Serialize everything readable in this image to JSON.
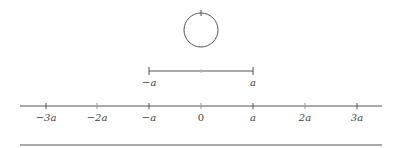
{
  "figure": {
    "circle": {
      "cx": 201,
      "cy": 30,
      "r": 17,
      "stroke": "#555555"
    },
    "segment": {
      "x1": 149,
      "x2": 253,
      "y": 71,
      "left_label": "−a",
      "right_label": "a"
    },
    "axis": {
      "x1": 20,
      "x2": 382,
      "y": 106,
      "ticks": [
        {
          "x": 46,
          "label": "−3a"
        },
        {
          "x": 97,
          "label": "−2a"
        },
        {
          "x": 149,
          "label": "−a"
        },
        {
          "x": 201,
          "label": "0"
        },
        {
          "x": 253,
          "label": "a"
        },
        {
          "x": 305,
          "label": "2a"
        },
        {
          "x": 357,
          "label": "3a"
        }
      ]
    },
    "bottom_rule": {
      "x1": 20,
      "x2": 382,
      "y": 145
    },
    "line_color": "#555555"
  }
}
